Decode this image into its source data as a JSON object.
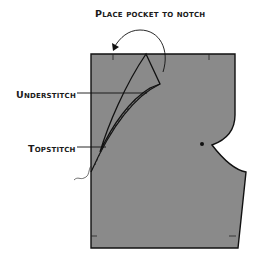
{
  "diagram": {
    "title": "Place pocket to notch",
    "labels": {
      "understitch": "Understitch",
      "topstitch": "Topstitch"
    },
    "colors": {
      "fabric": "#8a8a8a",
      "outline": "#111111",
      "background": "#ffffff"
    },
    "icons": {
      "curved-arrow": "rotate-left-arrow",
      "notch-dot": "filled-circle"
    }
  }
}
